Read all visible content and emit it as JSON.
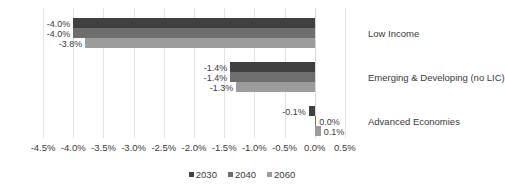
{
  "chart_data": {
    "type": "bar",
    "orientation": "horizontal",
    "title": "",
    "xlabel": "",
    "ylabel": "",
    "categories": [
      "Low Income",
      "Emerging & Developing (no LIC)",
      "Advanced Economies"
    ],
    "series": [
      {
        "name": "2030",
        "color": "#404040",
        "values": [
          -4.0,
          -1.4,
          -0.1
        ],
        "labels": [
          "-4.0%",
          "-1.4%",
          "-0.1%"
        ]
      },
      {
        "name": "2040",
        "color": "#6e6e6e",
        "values": [
          -4.0,
          -1.4,
          0.0
        ],
        "labels": [
          "-4.0%",
          "-1.4%",
          "0.0%"
        ]
      },
      {
        "name": "2060",
        "color": "#9c9c9c",
        "values": [
          -3.8,
          -1.3,
          0.1
        ],
        "labels": [
          "-3.8%",
          "-1.3%",
          "0.1%"
        ]
      }
    ],
    "xticks": [
      -4.5,
      -4.0,
      -3.5,
      -3.0,
      -2.5,
      -2.0,
      -1.5,
      -1.0,
      -0.5,
      0.0,
      0.5
    ],
    "xtick_labels": [
      "-4.5%",
      "-4.0%",
      "-3.5%",
      "-3.0%",
      "-2.5%",
      "-2.0%",
      "-1.5%",
      "-1.0%",
      "-0.5%",
      "0.0%",
      "0.5%"
    ],
    "xlim": [
      -4.75,
      0.75
    ],
    "grid": true,
    "legend_position": "bottom",
    "legend_entries": [
      "2030",
      "2040",
      "2060"
    ]
  }
}
